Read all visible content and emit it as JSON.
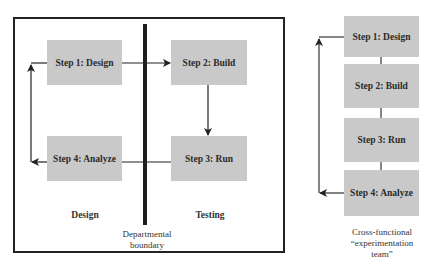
{
  "left_diagram": {
    "steps": [
      {
        "label": "Step 1: Design"
      },
      {
        "label": "Step 2: Build"
      },
      {
        "label": "Step 3: Run"
      },
      {
        "label": "Step 4: Analyze"
      }
    ],
    "zone_labels": {
      "left": "Design",
      "right": "Testing"
    },
    "boundary_label_line1": "Departmental",
    "boundary_label_line2": "boundary"
  },
  "right_diagram": {
    "steps": [
      {
        "label": "Step 1: Design"
      },
      {
        "label": "Step 2: Build"
      },
      {
        "label": "Step 3: Run"
      },
      {
        "label": "Step 4: Analyze"
      }
    ],
    "team_label_line1": "Cross-functional",
    "team_label_line2": "“experimentation",
    "team_label_line3": "team”"
  },
  "colors": {
    "box_fill": "#c9c9c9",
    "line": "#222222"
  }
}
